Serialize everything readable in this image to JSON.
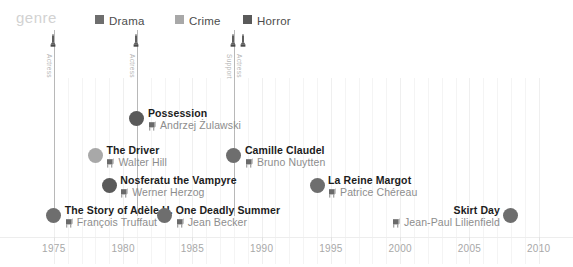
{
  "header": {
    "legend_title": "genre",
    "legend": [
      {
        "label": "Drama",
        "color": "#6e6e6e"
      },
      {
        "label": "Crime",
        "color": "#a8a8a8"
      },
      {
        "label": "Horror",
        "color": "#5a5a5a"
      }
    ]
  },
  "awards": [
    {
      "year": 1975,
      "labels": [
        "Actress"
      ],
      "icon": "oscar-statuette-icon"
    },
    {
      "year": 1981,
      "labels": [
        "Actress"
      ],
      "icon": "oscar-statuette-icon"
    },
    {
      "year": 1988,
      "labels": [
        "Support",
        "Actress"
      ],
      "icon": "oscar-statuette-icon"
    }
  ],
  "axis": {
    "ticks": [
      1975,
      1980,
      1985,
      1990,
      1995,
      2000,
      2005,
      2010
    ],
    "min": 1974,
    "max": 2010.6
  },
  "chart_data": {
    "type": "scatter",
    "title": "",
    "xlabel": "",
    "ylabel": "",
    "xlim": [
      1974,
      2010.6
    ],
    "grid": true,
    "legend_position": "top",
    "legend_title": "genre",
    "series": [
      {
        "name": "Drama",
        "color": "#6e6e6e"
      },
      {
        "name": "Crime",
        "color": "#a8a8a8"
      },
      {
        "name": "Horror",
        "color": "#5a5a5a"
      }
    ],
    "points": [
      {
        "title": "Possession",
        "director": "Andrzej Żulawski",
        "year": 1981,
        "genre": "Horror",
        "color": "#5a5a5a",
        "row": 0,
        "align": "left"
      },
      {
        "title": "The Driver",
        "director": "Walter Hill",
        "year": 1978,
        "genre": "Crime",
        "color": "#a8a8a8",
        "row": 1,
        "align": "left"
      },
      {
        "title": "Camille Claudel",
        "director": "Bruno Nuytten",
        "year": 1988,
        "genre": "Drama",
        "color": "#6e6e6e",
        "row": 1,
        "align": "left"
      },
      {
        "title": "Nosferatu the Vampyre",
        "director": "Werner Herzog",
        "year": 1979,
        "genre": "Horror",
        "color": "#5a5a5a",
        "row": 2,
        "align": "left"
      },
      {
        "title": "La Reine Margot",
        "director": "Patrice Chéreau",
        "year": 1994,
        "genre": "Drama",
        "color": "#6e6e6e",
        "row": 2,
        "align": "left"
      },
      {
        "title": "The Story of Adèle H.",
        "director": "François Truffaut",
        "year": 1975,
        "genre": "Drama",
        "color": "#6e6e6e",
        "row": 3,
        "align": "left"
      },
      {
        "title": "One Deadly Summer",
        "director": "Jean Becker",
        "year": 1983,
        "genre": "Drama",
        "color": "#6e6e6e",
        "row": 3,
        "align": "left"
      },
      {
        "title": "Skirt Day",
        "director": "Jean-Paul Lilienfield",
        "year": 2008,
        "genre": "Drama",
        "color": "#6e6e6e",
        "row": 3,
        "align": "right"
      }
    ]
  }
}
